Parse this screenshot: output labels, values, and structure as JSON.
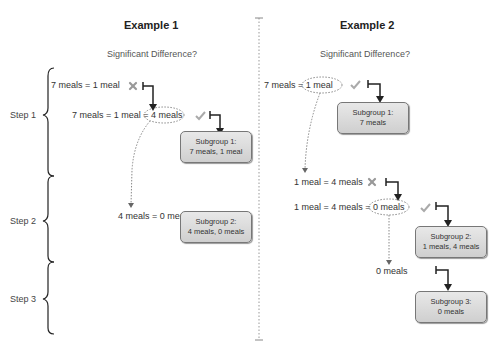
{
  "example1": {
    "title": "Example 1",
    "subtitle": "Significant Difference?",
    "steps": [
      "Step 1",
      "Step 2",
      "Step 3"
    ],
    "statements": [
      {
        "text": "7 meals = 1 meal",
        "result": "cross"
      },
      {
        "text": "7 meals = 1 meal = 4 meals",
        "result": "check"
      },
      {
        "text": "4 meals = 0 meals",
        "result": "cross"
      }
    ],
    "subgroups": [
      {
        "line1": "Subgroup 1:",
        "line2": "7 meals, 1 meal"
      },
      {
        "line1": "Subgroup 2:",
        "line2": "4 meals, 0 meals"
      }
    ]
  },
  "example2": {
    "title": "Example 2",
    "subtitle": "Significant Difference?",
    "statements": [
      {
        "text": "7 meals = 1 meal",
        "result": "check"
      },
      {
        "text": "1 meal = 4 meals",
        "result": "cross"
      },
      {
        "text": "1 meal = 4 meals = 0 meals",
        "result": "check"
      },
      {
        "text": "0 meals",
        "result": "none"
      }
    ],
    "subgroups": [
      {
        "line1": "Subgroup 1:",
        "line2": "7 meals"
      },
      {
        "line1": "Subgroup 2:",
        "line2": "1 meals, 4 meals"
      },
      {
        "line1": "Subgroup 3:",
        "line2": "0 meals"
      }
    ]
  },
  "colors": {
    "cross": "#999999",
    "check": "#aaaaaa",
    "arrow": "#222222"
  }
}
